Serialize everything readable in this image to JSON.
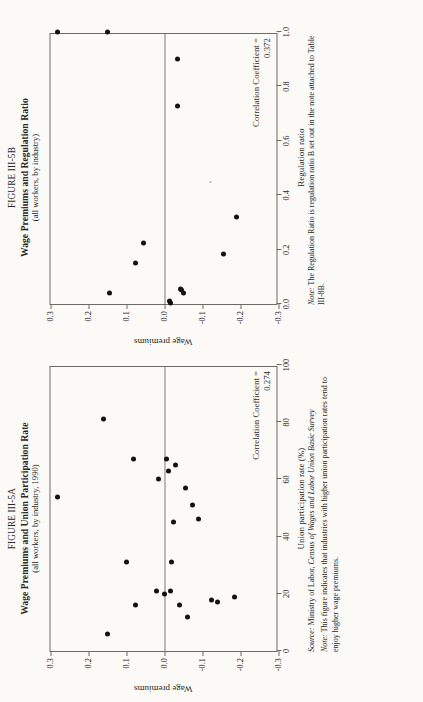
{
  "page": {
    "background_color": "#fbfaf7",
    "ink_color": "#14110e",
    "axis_color": "#6e6a64",
    "rotation": "90deg counter-clockwise"
  },
  "figure_a": {
    "figure_number": "FIGURE III-5A",
    "title": "Wage Premiums and Union Participation Rate",
    "subtitle": "(all workers, by industry, 1990)",
    "correlation_label": "Correlation Coefficient =",
    "correlation_value": "0.274",
    "source_lead": "Source:",
    "source_text_plain": "Ministry of Labor,",
    "source_text_italic": "Census of Wages and Labor Union Basic Survey",
    "note_lead": "Note:",
    "note_text": "This figure indicates that industries with higher union participation rates tend to enjoy higher wage premiums."
  },
  "figure_b": {
    "figure_number": "FIGURE III-5B",
    "title": "Wage Premiums and Regulation Ratio",
    "subtitle": "(all workers, by industry)",
    "correlation_label": "Correlation Coefficient =",
    "correlation_value": "0.372",
    "note_lead": "Note:",
    "note_text": "The Regulation Ratio is regulation ratio B set out in the note attached to Table III-8B."
  },
  "chart_data": [
    {
      "id": "figure-III-5A",
      "type": "scatter",
      "title": "Wage Premiums and Union Participation Rate",
      "subtitle": "(all workers, by industry, 1990)",
      "xlabel": "Union participation rate (%)",
      "ylabel": "Wage premiums",
      "xlim": [
        0,
        100
      ],
      "ylim": [
        -0.3,
        0.3
      ],
      "xticks": [
        0,
        20,
        40,
        60,
        80,
        100
      ],
      "xticklabels": [
        "0",
        "20",
        "40",
        "60",
        "80",
        "100"
      ],
      "yticks": [
        0.3,
        0.2,
        0.1,
        0.0,
        -0.1,
        -0.2,
        -0.3
      ],
      "yticklabels": [
        "0.3",
        "0.2",
        "0.1",
        "0.0",
        "-0.1",
        "-0.2",
        "-0.3"
      ],
      "grid": false,
      "zero_reference_line": 0.0,
      "legend": "none",
      "annotation": "Correlation Coefficient = 0.274",
      "correlation_coefficient": 0.274,
      "n_points": 23,
      "points": [
        {
          "x": 54,
          "y": 0.28
        },
        {
          "x": 81,
          "y": 0.16
        },
        {
          "x": 67,
          "y": 0.08
        },
        {
          "x": 31,
          "y": 0.1
        },
        {
          "x": 6,
          "y": 0.15
        },
        {
          "x": 60,
          "y": 0.015
        },
        {
          "x": 21,
          "y": 0.02
        },
        {
          "x": 16,
          "y": 0.075
        },
        {
          "x": 20,
          "y": 0.0
        },
        {
          "x": 67,
          "y": -0.005
        },
        {
          "x": 21,
          "y": -0.015
        },
        {
          "x": 31,
          "y": -0.02
        },
        {
          "x": 45,
          "y": -0.025
        },
        {
          "x": 65,
          "y": -0.03
        },
        {
          "x": 16,
          "y": -0.04
        },
        {
          "x": 57,
          "y": -0.055
        },
        {
          "x": 12,
          "y": -0.06
        },
        {
          "x": 51,
          "y": -0.075
        },
        {
          "x": 46,
          "y": -0.09
        },
        {
          "x": 18,
          "y": -0.125
        },
        {
          "x": 17,
          "y": -0.14
        },
        {
          "x": 19,
          "y": -0.185
        },
        {
          "x": 63,
          "y": -0.012
        }
      ]
    },
    {
      "id": "figure-III-5B",
      "type": "scatter",
      "title": "Wage Premiums and Regulation Ratio",
      "subtitle": "(all workers, by industry)",
      "xlabel": "Regulation ratio",
      "ylabel": "Wage premiums",
      "xlim": [
        0.0,
        1.0
      ],
      "ylim": [
        -0.3,
        0.3
      ],
      "xticks": [
        0.0,
        0.2,
        0.4,
        0.6,
        0.8,
        1.0
      ],
      "xticklabels": [
        "0.0",
        "0.2",
        "0.4",
        "0.6",
        "0.8",
        "1.0"
      ],
      "yticks": [
        0.3,
        0.2,
        0.1,
        0.0,
        -0.1,
        -0.2,
        -0.3
      ],
      "yticklabels": [
        "0.3",
        "0.2",
        "0.1",
        "0.0",
        "-0.1",
        "-0.2",
        "-0.3"
      ],
      "grid": false,
      "zero_reference_line": 0.0,
      "legend": "none",
      "annotation": "Correlation Coefficient = 0.372",
      "correlation_coefficient": 0.372,
      "n_points": 12,
      "points": [
        {
          "x": 1.0,
          "y": 0.28
        },
        {
          "x": 1.0,
          "y": 0.15
        },
        {
          "x": 0.9,
          "y": -0.035
        },
        {
          "x": 0.73,
          "y": -0.035
        },
        {
          "x": 0.32,
          "y": -0.19
        },
        {
          "x": 0.185,
          "y": -0.155
        },
        {
          "x": 0.225,
          "y": 0.055
        },
        {
          "x": 0.15,
          "y": 0.075
        },
        {
          "x": 0.04,
          "y": 0.145
        },
        {
          "x": 0.005,
          "y": -0.015
        },
        {
          "x": 0.012,
          "y": -0.013
        },
        {
          "x": 0.04,
          "y": -0.05
        },
        {
          "x": 0.05,
          "y": -0.045
        },
        {
          "x": 0.055,
          "y": -0.042
        }
      ]
    }
  ]
}
